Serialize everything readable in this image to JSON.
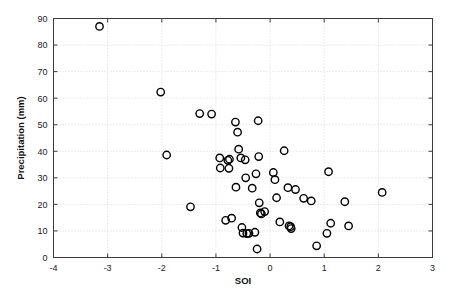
{
  "chart_data": {
    "type": "scatter",
    "title": "",
    "xlabel": "SOI",
    "ylabel": "Precipitation (mm)",
    "xlim": [
      -4,
      3
    ],
    "ylim": [
      0,
      90
    ],
    "xticks": [
      -4,
      -3,
      -2,
      -1,
      0,
      1,
      2,
      3
    ],
    "xtick_labels": [
      "-4",
      "-3",
      "-2",
      "-1",
      "0",
      "1",
      "2",
      "3"
    ],
    "yticks": [
      0,
      10,
      20,
      30,
      40,
      50,
      60,
      70,
      80,
      90
    ],
    "ytick_labels": [
      "0",
      "10",
      "20",
      "30",
      "40",
      "50",
      "60",
      "70",
      "80",
      "90"
    ],
    "grid": true,
    "grid_style": "dotted",
    "legend": "none",
    "marker": "open-circle",
    "marker_color": "#000000",
    "marker_size": 5,
    "n_points": 57,
    "points": [
      {
        "x": -3.15,
        "y": 87.0
      },
      {
        "x": -2.02,
        "y": 62.3
      },
      {
        "x": -1.91,
        "y": 38.6
      },
      {
        "x": -1.47,
        "y": 19.1
      },
      {
        "x": -1.3,
        "y": 54.2
      },
      {
        "x": -1.08,
        "y": 54.0
      },
      {
        "x": -0.93,
        "y": 37.5
      },
      {
        "x": -0.92,
        "y": 33.7
      },
      {
        "x": -0.82,
        "y": 14.0
      },
      {
        "x": -0.78,
        "y": 36.6
      },
      {
        "x": -0.76,
        "y": 33.6
      },
      {
        "x": -0.75,
        "y": 37.0
      },
      {
        "x": -0.71,
        "y": 14.8
      },
      {
        "x": -0.64,
        "y": 51.0
      },
      {
        "x": -0.63,
        "y": 26.5
      },
      {
        "x": -0.6,
        "y": 47.2
      },
      {
        "x": -0.58,
        "y": 40.8
      },
      {
        "x": -0.54,
        "y": 37.5
      },
      {
        "x": -0.52,
        "y": 11.3
      },
      {
        "x": -0.5,
        "y": 9.2
      },
      {
        "x": -0.46,
        "y": 36.8
      },
      {
        "x": -0.45,
        "y": 30.0
      },
      {
        "x": -0.43,
        "y": 9.0
      },
      {
        "x": -0.39,
        "y": 9.1
      },
      {
        "x": -0.33,
        "y": 26.1
      },
      {
        "x": -0.28,
        "y": 9.5
      },
      {
        "x": -0.26,
        "y": 31.5
      },
      {
        "x": -0.24,
        "y": 3.2
      },
      {
        "x": -0.22,
        "y": 51.5
      },
      {
        "x": -0.21,
        "y": 38.0
      },
      {
        "x": -0.2,
        "y": 20.6
      },
      {
        "x": -0.18,
        "y": 16.8
      },
      {
        "x": -0.16,
        "y": 16.4
      },
      {
        "x": -0.1,
        "y": 17.3
      },
      {
        "x": 0.06,
        "y": 32.0
      },
      {
        "x": 0.09,
        "y": 29.3
      },
      {
        "x": 0.12,
        "y": 22.5
      },
      {
        "x": 0.18,
        "y": 13.4
      },
      {
        "x": 0.26,
        "y": 40.2
      },
      {
        "x": 0.33,
        "y": 26.3
      },
      {
        "x": 0.35,
        "y": 11.9
      },
      {
        "x": 0.38,
        "y": 11.6
      },
      {
        "x": 0.39,
        "y": 10.9
      },
      {
        "x": 0.47,
        "y": 25.6
      },
      {
        "x": 0.62,
        "y": 22.3
      },
      {
        "x": 0.76,
        "y": 21.3
      },
      {
        "x": 0.86,
        "y": 4.4
      },
      {
        "x": 1.05,
        "y": 9.1
      },
      {
        "x": 1.08,
        "y": 32.3
      },
      {
        "x": 1.12,
        "y": 12.9
      },
      {
        "x": 1.38,
        "y": 21.0
      },
      {
        "x": 1.45,
        "y": 11.9
      },
      {
        "x": 2.07,
        "y": 24.5
      }
    ]
  },
  "figure": {
    "background_color": "#ffffff",
    "frame_color": "#3c3c3c",
    "grid_color": "#c9c9c9"
  }
}
